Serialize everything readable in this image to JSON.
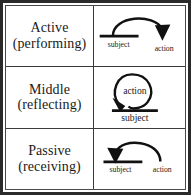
{
  "diagram": {
    "colors": {
      "ink": "#111111",
      "frame": "#2b2b2b",
      "background": "#ffffff"
    },
    "rows": [
      {
        "id": "active",
        "label_line1": "Active",
        "label_line2": "(performing)",
        "figure": {
          "name": "active-voice-figure",
          "description": "Arc springing from the subject line, curving up and over to the right, ending in a downward arrowhead above 'action'",
          "left_label": "subject",
          "right_label": "action"
        }
      },
      {
        "id": "middle",
        "label_line1": "Middle",
        "label_line2": "(reflecting)",
        "figure": {
          "name": "middle-voice-figure",
          "description": "Closed loop rising from the subject line and curving back down onto itself with a downward arrowhead; 'action' sits inside the loop",
          "inner_label": "action",
          "baseline_label": "subject"
        }
      },
      {
        "id": "passive",
        "label_line1": "Passive",
        "label_line2": "(receiving)",
        "figure": {
          "name": "passive-voice-figure",
          "description": "Arc springing from 'action' on the right, curving up and over to the left, ending in a downward arrowhead onto the subject line",
          "left_label": "subject",
          "right_label": "action"
        }
      }
    ]
  }
}
